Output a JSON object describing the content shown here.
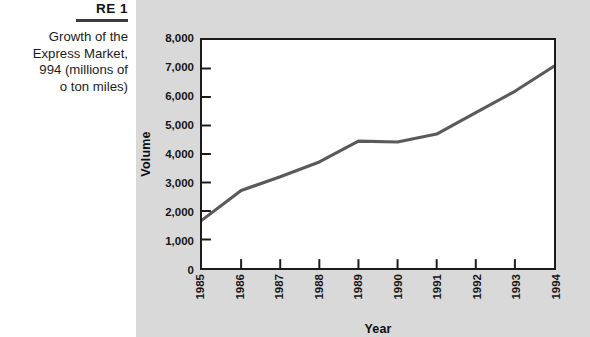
{
  "figure": {
    "label": "RE 1",
    "caption_lines": [
      "Growth of the",
      "Express Market,",
      "994 (millions of",
      "o ton miles)"
    ]
  },
  "colors": {
    "panel_background": "#d9d9d9",
    "page_background": "#ffffff",
    "plot_background": "#ffffff",
    "axis": "#1b1b1b",
    "line": "#5a5a5a",
    "rule": "#3b3b45",
    "text": "#161616"
  },
  "chart_data": {
    "type": "line",
    "title": "",
    "xlabel": "Year",
    "ylabel": "Volume",
    "categories": [
      "1985",
      "1986",
      "1987",
      "1988",
      "1989",
      "1990",
      "1991",
      "1992",
      "1993",
      "1994"
    ],
    "x": [
      1985,
      1986,
      1987,
      1988,
      1989,
      1990,
      1991,
      1992,
      1993,
      1994
    ],
    "values": [
      1680,
      2720,
      3200,
      3720,
      4450,
      4420,
      4700,
      5450,
      6200,
      7080
    ],
    "ylim": [
      0,
      8000
    ],
    "ytick_labels": [
      "0",
      "1,000",
      "2,000",
      "3,000",
      "4,000",
      "5,000",
      "6,000",
      "7,000",
      "8,000"
    ],
    "ytick_values": [
      0,
      1000,
      2000,
      3000,
      4000,
      5000,
      6000,
      7000,
      8000
    ],
    "grid": false,
    "legend": "none",
    "series": [
      {
        "name": "Volume",
        "values": [
          1680,
          2720,
          3200,
          3720,
          4450,
          4420,
          4700,
          5450,
          6200,
          7080
        ]
      }
    ]
  }
}
